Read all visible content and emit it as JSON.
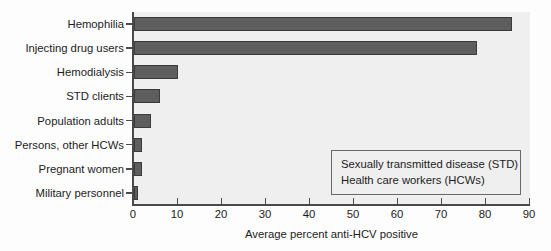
{
  "chart_data": {
    "type": "bar",
    "orientation": "horizontal",
    "title": "",
    "xlabel": "Average percent anti-HCV positive",
    "ylabel": "",
    "xlim": [
      0,
      90
    ],
    "xticks": [
      0,
      10,
      20,
      30,
      40,
      50,
      60,
      70,
      80,
      90
    ],
    "grid": false,
    "legend": null,
    "categories": [
      "Hemophilia",
      "Injecting drug users",
      "Hemodialysis",
      "STD clients",
      "Population adults",
      "Persons, other HCWs",
      "Pregnant women",
      "Military personnel"
    ],
    "values": [
      86,
      78,
      10,
      6,
      4,
      2,
      2,
      1
    ],
    "annotations": [
      "Sexually transmitted disease (STD)",
      "Health care workers (HCWs)"
    ],
    "colors": {
      "bar_fill": "#5e5e5e",
      "bar_edge": "#3b3b3b",
      "plot_background": "#efefef",
      "axis": "#4a4a4a",
      "text": "#1c1c1c",
      "page_background": "#fdfdfd"
    }
  },
  "note_box": {
    "lines": [
      "Sexually transmitted disease (STD)",
      "Health care workers (HCWs)"
    ]
  }
}
